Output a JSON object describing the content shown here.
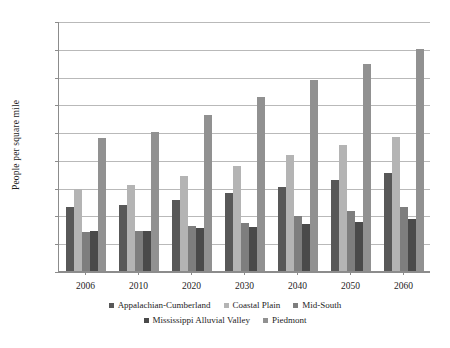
{
  "chart_data": {
    "type": "bar",
    "title": "",
    "subtitle": "",
    "xlabel": "",
    "ylabel": "People per square mile",
    "ylim": [
      0,
      450
    ],
    "ytick_step": 50,
    "yticks": [
      450,
      400,
      350,
      300,
      250,
      200,
      150,
      100,
      50,
      0
    ],
    "grid": true,
    "legend_position": "bottom",
    "categories": [
      "2006",
      "2010",
      "2020",
      "2030",
      "2040",
      "2050",
      "2060"
    ],
    "series": [
      {
        "name": "Appalachian-Cumberland",
        "color": "#585858",
        "values": [
          115,
          119,
          128,
          140,
          151,
          163,
          177
        ]
      },
      {
        "name": "Coastal Plain",
        "color": "#b4b4b4",
        "values": [
          148,
          154,
          171,
          189,
          208,
          226,
          242
        ]
      },
      {
        "name": "Mid-South",
        "color": "#7e7e7e",
        "values": [
          71,
          72,
          81,
          87,
          99,
          108,
          116
        ]
      },
      {
        "name": "Mississippi Alluvial Valley",
        "color": "#4a4a4a",
        "values": [
          72,
          72,
          77,
          80,
          85,
          89,
          93
        ]
      },
      {
        "name": "Piedmont",
        "color": "#919191",
        "values": [
          240,
          250,
          280,
          313,
          343,
          372,
          400
        ]
      }
    ]
  },
  "legend": {
    "row1": [
      "Appalachian-Cumberland",
      "Coastal Plain",
      "Mid-South"
    ],
    "row2": [
      "Mississippi Alluvial Valley",
      "Piedmont"
    ]
  },
  "colors": {
    "axis": "#8c8c8c",
    "grid": "#b9b9b9",
    "text": "#1d1d1d",
    "background": "#ffffff"
  }
}
